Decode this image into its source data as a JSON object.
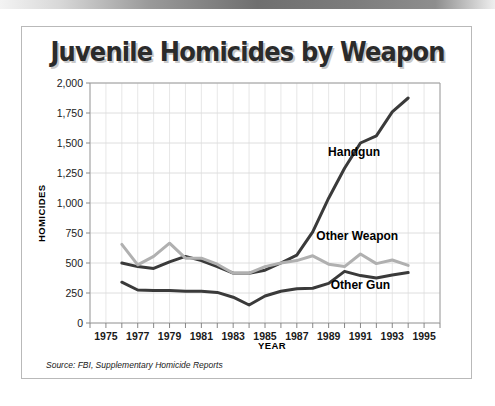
{
  "page": {
    "top_bar_name": "page-edge-bar"
  },
  "chart_data": {
    "type": "line",
    "title": "Juvenile Homicides by Weapon",
    "xlabel": "YEAR",
    "ylabel": "HOMICIDES",
    "source": "Source: FBI, Supplementary Homicide Reports",
    "x": [
      1976,
      1977,
      1978,
      1979,
      1980,
      1981,
      1982,
      1983,
      1984,
      1985,
      1986,
      1987,
      1988,
      1989,
      1990,
      1991,
      1992,
      1993,
      1994
    ],
    "xlim": [
      1974,
      1996
    ],
    "ylim": [
      0,
      2000
    ],
    "ytick_labels": [
      "0",
      "250",
      "500",
      "750",
      "1,000",
      "1,250",
      "1,500",
      "1,750",
      "2,000"
    ],
    "ytick_values": [
      0,
      250,
      500,
      750,
      1000,
      1250,
      1500,
      1750,
      2000
    ],
    "xtick_labels": [
      "1975",
      "1977",
      "1979",
      "1981",
      "1983",
      "1985",
      "1987",
      "1989",
      "1991",
      "1993",
      "1995"
    ],
    "xtick_values": [
      1975,
      1977,
      1979,
      1981,
      1983,
      1985,
      1987,
      1989,
      1991,
      1993,
      1995
    ],
    "grid": true,
    "legend": "inline-labels",
    "series": [
      {
        "name": "Handgun",
        "color": "#3a3a3a",
        "width": 3.0,
        "label_x": 1990.6,
        "label_y": 1390,
        "values": [
          500,
          470,
          455,
          510,
          555,
          520,
          470,
          415,
          415,
          440,
          500,
          565,
          760,
          1040,
          1290,
          1500,
          1560,
          1760,
          1875
        ]
      },
      {
        "name": "Other Weapon",
        "color": "#b0b0b0",
        "width": 3.0,
        "label_x": 1990.8,
        "label_y": 690,
        "values": [
          655,
          485,
          555,
          665,
          540,
          540,
          490,
          415,
          415,
          470,
          500,
          520,
          560,
          490,
          470,
          575,
          495,
          525,
          480
        ]
      },
      {
        "name": "Other Gun",
        "color": "#3a3a3a",
        "width": 3.0,
        "label_x": 1991.0,
        "label_y": 285,
        "values": [
          340,
          275,
          270,
          270,
          265,
          265,
          255,
          215,
          150,
          225,
          265,
          285,
          290,
          330,
          430,
          395,
          375,
          400,
          420
        ]
      }
    ]
  }
}
